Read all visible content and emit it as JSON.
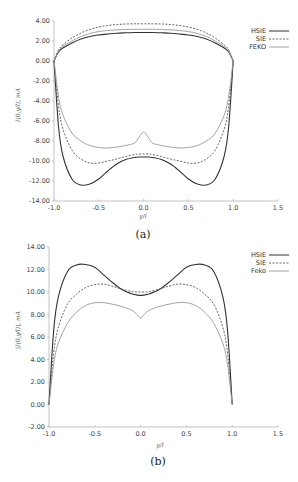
{
  "chart_data": [
    {
      "type": "line",
      "caption": "(a)",
      "title": "",
      "xlabel": "y/l",
      "ylabel": "I(0,y/l), mA",
      "xlim": [
        -1.0,
        1.5
      ],
      "ylim": [
        -14.0,
        4.0
      ],
      "xticks": [
        "-1.0",
        "-0.5",
        "0.0",
        "0.5",
        "1.0",
        "1.5"
      ],
      "yticks": [
        "4.00",
        "2.00",
        "0.00",
        "-2.00",
        "-4.00",
        "-6.00",
        "-8.00",
        "-10.00",
        "-12.00",
        "-14.00"
      ],
      "grid": false,
      "legend_position": "upper right",
      "x": [
        -1.0,
        -0.95,
        -0.9,
        -0.8,
        -0.7,
        -0.6,
        -0.5,
        -0.4,
        -0.3,
        -0.2,
        -0.1,
        -0.05,
        0.0,
        0.05,
        0.1,
        0.2,
        0.3,
        0.4,
        0.5,
        0.6,
        0.7,
        0.8,
        0.9,
        0.95,
        1.0
      ],
      "series": [
        {
          "name": "HSIE",
          "style": "solid-dark",
          "part": "upper",
          "values": [
            0.0,
            0.9,
            1.3,
            1.8,
            2.2,
            2.45,
            2.6,
            2.7,
            2.78,
            2.82,
            2.85,
            2.85,
            2.85,
            2.85,
            2.85,
            2.82,
            2.78,
            2.7,
            2.6,
            2.45,
            2.2,
            1.8,
            1.3,
            0.9,
            0.0
          ]
        },
        {
          "name": "SIE",
          "style": "dashed",
          "part": "upper",
          "values": [
            0.0,
            1.1,
            1.6,
            2.3,
            2.8,
            3.15,
            3.4,
            3.55,
            3.65,
            3.7,
            3.72,
            3.72,
            3.72,
            3.72,
            3.72,
            3.7,
            3.65,
            3.55,
            3.4,
            3.15,
            2.8,
            2.3,
            1.6,
            1.1,
            0.0
          ]
        },
        {
          "name": "FEKO",
          "style": "solid-light",
          "part": "upper",
          "values": [
            0.0,
            1.0,
            1.45,
            2.0,
            2.45,
            2.75,
            2.95,
            3.05,
            3.12,
            3.15,
            3.17,
            3.17,
            3.17,
            3.17,
            3.17,
            3.15,
            3.12,
            3.05,
            2.95,
            2.75,
            2.45,
            2.0,
            1.45,
            1.0,
            0.0
          ]
        },
        {
          "name": "HSIE",
          "style": "solid-dark",
          "part": "lower",
          "values": [
            0.0,
            -6.5,
            -9.5,
            -11.8,
            -12.4,
            -12.3,
            -11.8,
            -11.0,
            -10.3,
            -9.85,
            -9.65,
            -9.6,
            -9.6,
            -9.6,
            -9.65,
            -9.85,
            -10.3,
            -11.0,
            -11.8,
            -12.3,
            -12.4,
            -11.8,
            -9.5,
            -6.5,
            0.0
          ]
        },
        {
          "name": "SIE",
          "style": "dashed",
          "part": "lower",
          "values": [
            0.0,
            -4.5,
            -6.8,
            -8.9,
            -9.8,
            -10.2,
            -10.2,
            -10.0,
            -9.8,
            -9.55,
            -9.35,
            -9.3,
            -9.3,
            -9.3,
            -9.35,
            -9.55,
            -9.8,
            -10.0,
            -10.2,
            -10.2,
            -9.8,
            -8.9,
            -6.8,
            -4.5,
            0.0
          ]
        },
        {
          "name": "FEKO",
          "style": "solid-light",
          "part": "lower",
          "values": [
            0.0,
            -3.5,
            -5.4,
            -7.2,
            -8.0,
            -8.45,
            -8.65,
            -8.7,
            -8.6,
            -8.45,
            -8.2,
            -7.6,
            -7.1,
            -7.6,
            -8.2,
            -8.45,
            -8.6,
            -8.7,
            -8.65,
            -8.45,
            -8.0,
            -7.2,
            -5.4,
            -3.5,
            0.0
          ]
        }
      ],
      "legend": [
        "HSIE",
        "SIE",
        "FEKO"
      ]
    },
    {
      "type": "line",
      "caption": "(b)",
      "title": "",
      "xlabel": "y/l",
      "ylabel": "|I(0,y/l)|, mA",
      "xlim": [
        -1.0,
        1.5
      ],
      "ylim": [
        -2.0,
        14.0
      ],
      "xticks": [
        "-1.0",
        "-0.5",
        "0.0",
        "0.5",
        "1.0",
        "1.5"
      ],
      "yticks": [
        "14.00",
        "12.00",
        "10.00",
        "8.00",
        "6.00",
        "4.00",
        "2.00",
        "0.00",
        "-2.00"
      ],
      "grid": false,
      "legend_position": "upper right",
      "x": [
        -1.0,
        -0.95,
        -0.9,
        -0.8,
        -0.7,
        -0.6,
        -0.5,
        -0.4,
        -0.3,
        -0.2,
        -0.1,
        -0.05,
        0.0,
        0.05,
        0.1,
        0.2,
        0.3,
        0.4,
        0.5,
        0.6,
        0.7,
        0.8,
        0.9,
        0.95,
        1.0
      ],
      "series": [
        {
          "name": "HSIE",
          "style": "solid-dark",
          "values": [
            0.0,
            6.5,
            9.5,
            11.8,
            12.4,
            12.45,
            12.2,
            11.5,
            10.8,
            10.2,
            9.85,
            9.75,
            9.7,
            9.75,
            9.85,
            10.2,
            10.8,
            11.5,
            12.2,
            12.45,
            12.4,
            11.8,
            9.5,
            6.5,
            0.0
          ]
        },
        {
          "name": "SIE",
          "style": "dashed",
          "values": [
            0.0,
            4.5,
            6.8,
            8.9,
            9.8,
            10.4,
            10.65,
            10.7,
            10.5,
            10.25,
            10.05,
            10.0,
            10.0,
            10.0,
            10.05,
            10.25,
            10.5,
            10.7,
            10.65,
            10.4,
            9.8,
            8.9,
            6.8,
            4.5,
            0.0
          ]
        },
        {
          "name": "Feko",
          "style": "solid-light",
          "values": [
            0.0,
            3.5,
            5.4,
            7.2,
            8.2,
            8.8,
            9.05,
            9.05,
            8.9,
            8.7,
            8.4,
            8.1,
            7.7,
            8.1,
            8.4,
            8.7,
            8.9,
            9.05,
            9.05,
            8.8,
            8.2,
            7.2,
            5.4,
            3.5,
            0.0
          ]
        }
      ],
      "legend": [
        "HSIE",
        "SIE",
        "Feko"
      ]
    }
  ],
  "figures": {
    "a": {
      "caption": "(a)",
      "xlabel": "y/l",
      "ylabel": "I(0,y/l), mA",
      "legend": {
        "hsie": "HSIE",
        "sie": "SIE",
        "feko": "FEKO"
      }
    },
    "b": {
      "caption": "(b)",
      "xlabel": "y/l",
      "ylabel": "|I(0,y/l)|, mA",
      "legend": {
        "hsie": "HSIE",
        "sie": "SIE",
        "feko": "Feko"
      }
    }
  },
  "colors": {
    "hsie": "#333333",
    "sie": "#555555",
    "feko": "#999999",
    "axis": "#aaaaaa"
  }
}
